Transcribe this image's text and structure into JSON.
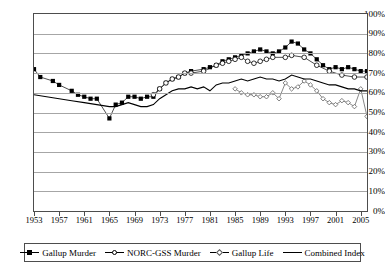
{
  "chart_data": {
    "type": "line",
    "title": "",
    "xlabel": "",
    "ylabel": "",
    "ylim": [
      0,
      100
    ],
    "xlim": [
      1953,
      2006
    ],
    "grid": true,
    "legend_position": "bottom",
    "y_ticks": [
      "0%",
      "10%",
      "20%",
      "30%",
      "40%",
      "50%",
      "60%",
      "70%",
      "80%",
      "90%",
      "100%"
    ],
    "x_ticks": [
      "1953",
      "1957",
      "1961",
      "1965",
      "1969",
      "1973",
      "1977",
      "1981",
      "1985",
      "1989",
      "1993",
      "1997",
      "2001",
      "2005"
    ],
    "series": [
      {
        "name": "Gallup Murder",
        "marker": "filled-square",
        "color": "#000000",
        "points": [
          [
            1953,
            72
          ],
          [
            1954,
            68
          ],
          [
            1956,
            66
          ],
          [
            1957,
            64
          ],
          [
            1959,
            61
          ],
          [
            1960,
            59
          ],
          [
            1961,
            58
          ],
          [
            1962,
            57
          ],
          [
            1963,
            57
          ],
          [
            1965,
            47
          ],
          [
            1966,
            54
          ],
          [
            1967,
            55
          ],
          [
            1968,
            58
          ],
          [
            1969,
            58
          ],
          [
            1970,
            57
          ],
          [
            1971,
            58
          ],
          [
            1972,
            58
          ],
          [
            1973,
            62
          ],
          [
            1974,
            65
          ],
          [
            1975,
            67
          ],
          [
            1976,
            68
          ],
          [
            1977,
            70
          ],
          [
            1978,
            71
          ],
          [
            1980,
            72
          ],
          [
            1981,
            73
          ],
          [
            1982,
            74
          ],
          [
            1983,
            76
          ],
          [
            1984,
            77
          ],
          [
            1985,
            78
          ],
          [
            1986,
            79
          ],
          [
            1987,
            80
          ],
          [
            1988,
            81
          ],
          [
            1989,
            82
          ],
          [
            1990,
            81
          ],
          [
            1991,
            80
          ],
          [
            1992,
            81
          ],
          [
            1993,
            83
          ],
          [
            1994,
            86
          ],
          [
            1995,
            85
          ],
          [
            1996,
            82
          ],
          [
            1997,
            80
          ],
          [
            1998,
            77
          ],
          [
            1999,
            74
          ],
          [
            2000,
            72
          ],
          [
            2001,
            73
          ],
          [
            2002,
            72
          ],
          [
            2003,
            73
          ],
          [
            2004,
            72
          ],
          [
            2005,
            71
          ],
          [
            2006,
            71
          ]
        ]
      },
      {
        "name": "NORC-GSS Murder",
        "marker": "open-circle",
        "color": "#000000",
        "points": [
          [
            1972,
            59
          ],
          [
            1973,
            62
          ],
          [
            1974,
            65
          ],
          [
            1975,
            67
          ],
          [
            1976,
            68
          ],
          [
            1977,
            70
          ],
          [
            1978,
            70
          ],
          [
            1980,
            71
          ],
          [
            1982,
            74
          ],
          [
            1983,
            75
          ],
          [
            1984,
            76
          ],
          [
            1985,
            77
          ],
          [
            1986,
            78
          ],
          [
            1987,
            76
          ],
          [
            1988,
            75
          ],
          [
            1989,
            76
          ],
          [
            1990,
            77
          ],
          [
            1991,
            78
          ],
          [
            1993,
            78
          ],
          [
            1994,
            79
          ],
          [
            1996,
            78
          ],
          [
            1998,
            74
          ],
          [
            2000,
            71
          ],
          [
            2002,
            69
          ],
          [
            2004,
            68
          ],
          [
            2006,
            68
          ]
        ]
      },
      {
        "name": "Gallup Life",
        "marker": "open-diamond",
        "color": "#555555",
        "points": [
          [
            1985,
            62
          ],
          [
            1986,
            60
          ],
          [
            1987,
            59
          ],
          [
            1988,
            59
          ],
          [
            1989,
            58
          ],
          [
            1990,
            58
          ],
          [
            1991,
            60
          ],
          [
            1992,
            57
          ],
          [
            1993,
            65
          ],
          [
            1994,
            62
          ],
          [
            1995,
            63
          ],
          [
            1996,
            66
          ],
          [
            1997,
            64
          ],
          [
            1998,
            61
          ],
          [
            1999,
            57
          ],
          [
            2000,
            55
          ],
          [
            2001,
            54
          ],
          [
            2002,
            56
          ],
          [
            2003,
            55
          ],
          [
            2004,
            53
          ],
          [
            2005,
            62
          ],
          [
            2006,
            48
          ]
        ]
      },
      {
        "name": "Combined Index",
        "marker": "none",
        "color": "#000000",
        "points": [
          [
            1953,
            59
          ],
          [
            1955,
            58
          ],
          [
            1957,
            57
          ],
          [
            1959,
            56
          ],
          [
            1961,
            55
          ],
          [
            1963,
            54
          ],
          [
            1965,
            53
          ],
          [
            1966,
            53
          ],
          [
            1967,
            54
          ],
          [
            1968,
            55
          ],
          [
            1969,
            54
          ],
          [
            1970,
            53
          ],
          [
            1971,
            53
          ],
          [
            1972,
            54
          ],
          [
            1973,
            57
          ],
          [
            1974,
            59
          ],
          [
            1975,
            61
          ],
          [
            1976,
            62
          ],
          [
            1977,
            62
          ],
          [
            1978,
            63
          ],
          [
            1979,
            62
          ],
          [
            1980,
            63
          ],
          [
            1981,
            61
          ],
          [
            1982,
            64
          ],
          [
            1983,
            65
          ],
          [
            1984,
            65
          ],
          [
            1985,
            66
          ],
          [
            1986,
            67
          ],
          [
            1987,
            66
          ],
          [
            1988,
            67
          ],
          [
            1989,
            68
          ],
          [
            1990,
            67
          ],
          [
            1991,
            67
          ],
          [
            1992,
            66
          ],
          [
            1993,
            67
          ],
          [
            1994,
            69
          ],
          [
            1995,
            68
          ],
          [
            1996,
            67
          ],
          [
            1997,
            67
          ],
          [
            1998,
            66
          ],
          [
            1999,
            65
          ],
          [
            2000,
            64
          ],
          [
            2001,
            64
          ],
          [
            2002,
            63
          ],
          [
            2003,
            62
          ],
          [
            2004,
            62
          ],
          [
            2005,
            61
          ],
          [
            2006,
            61
          ]
        ]
      }
    ]
  },
  "legend": {
    "items": [
      {
        "label": "Gallup Murder",
        "marker": "filled-square"
      },
      {
        "label": "NORC-GSS Murder",
        "marker": "open-circle"
      },
      {
        "label": "Gallup Life",
        "marker": "open-diamond"
      },
      {
        "label": "Combined Index",
        "marker": "none"
      }
    ]
  }
}
